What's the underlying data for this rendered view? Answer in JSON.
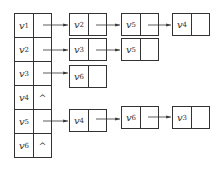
{
  "diagram": {
    "type": "adjacency-list",
    "head_nodes": [
      {
        "label": "v",
        "sub": "1",
        "null": ""
      },
      {
        "label": "v",
        "sub": "2",
        "null": ""
      },
      {
        "label": "v",
        "sub": "3",
        "null": ""
      },
      {
        "label": "v",
        "sub": "4",
        "null": "^"
      },
      {
        "label": "v",
        "sub": "5",
        "null": ""
      },
      {
        "label": "v",
        "sub": "6",
        "null": "^"
      }
    ],
    "adjacency": {
      "v1": [
        {
          "label": "v",
          "sub": "2"
        },
        {
          "label": "v",
          "sub": "5"
        },
        {
          "label": "v",
          "sub": "4"
        }
      ],
      "v2": [
        {
          "label": "v",
          "sub": "3"
        },
        {
          "label": "v",
          "sub": "5"
        }
      ],
      "v3": [
        {
          "label": "v",
          "sub": "6"
        }
      ],
      "v5": [
        {
          "label": "v",
          "sub": "4"
        },
        {
          "label": "v",
          "sub": "6"
        },
        {
          "label": "v",
          "sub": "3"
        }
      ]
    }
  }
}
